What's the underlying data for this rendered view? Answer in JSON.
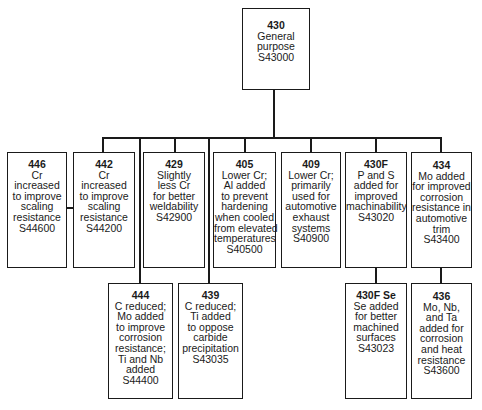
{
  "diagram": {
    "type": "tree",
    "root": {
      "code": "430",
      "lines": [
        "General",
        "purpose",
        "S43000"
      ]
    },
    "children": [
      {
        "code": "446",
        "lines": [
          "Cr",
          "increased",
          "to improve",
          "scaling",
          "resistance",
          "S44600"
        ],
        "connected_via": "442"
      },
      {
        "code": "442",
        "lines": [
          "Cr",
          "increased",
          "to improve",
          "scaling",
          "resistance",
          "S44200"
        ]
      },
      {
        "code": "429",
        "lines": [
          "Slightly",
          "less Cr",
          "for better",
          "weldability",
          "S42900"
        ]
      },
      {
        "code": "405",
        "lines": [
          "Lower Cr;",
          "Al added",
          "to prevent",
          "hardening",
          "when cooled",
          "from elevated",
          "temperatures",
          "S40500"
        ]
      },
      {
        "code": "409",
        "lines": [
          "Lower Cr;",
          "primarily",
          "used for",
          "automotive",
          "exhaust",
          "systems",
          "S40900"
        ]
      },
      {
        "code": "430F",
        "lines": [
          "P and S",
          "added for",
          "improved",
          "machinability",
          "S43020"
        ],
        "children": [
          {
            "code": "430F Se",
            "lines": [
              "Se added",
              "for better",
              "machined",
              "surfaces",
              "S43023"
            ]
          }
        ]
      },
      {
        "code": "434",
        "lines": [
          "Mo added",
          "for improved",
          "corrosion",
          "resistance in",
          "automotive",
          "trim",
          "S43400"
        ],
        "children": [
          {
            "code": "436",
            "lines": [
              "Mo, Nb,",
              "and Ta",
              "added for",
              "corrosion",
              "and heat",
              "resistance",
              "S43600"
            ]
          }
        ]
      },
      {
        "code": "444",
        "lines": [
          "C reduced;",
          "Mo added",
          "to improve",
          "corrosion",
          "resistance;",
          "Ti and Nb",
          "added",
          "S44400"
        ],
        "connected_from": "430 bus"
      },
      {
        "code": "439",
        "lines": [
          "C reduced;",
          "Ti added",
          "to oppose",
          "carbide",
          "precipitation",
          "S43035"
        ],
        "connected_from": "430 bus"
      }
    ]
  },
  "boxes": {
    "b430": {
      "code": "430",
      "l": [
        "General",
        "purpose",
        "S43000"
      ]
    },
    "b446": {
      "code": "446",
      "l": [
        "Cr",
        "increased",
        "to improve",
        "scaling",
        "resistance",
        "S44600"
      ]
    },
    "b442": {
      "code": "442",
      "l": [
        "Cr",
        "increased",
        "to improve",
        "scaling",
        "resistance",
        "S44200"
      ]
    },
    "b429": {
      "code": "429",
      "l": [
        "Slightly",
        "less Cr",
        "for better",
        "weldability",
        "S42900"
      ]
    },
    "b405": {
      "code": "405",
      "l": [
        "Lower Cr;",
        "Al added",
        "to prevent",
        "hardening",
        "when cooled",
        "from elevated",
        "temperatures",
        "S40500"
      ]
    },
    "b409": {
      "code": "409",
      "l": [
        "Lower Cr;",
        "primarily",
        "used for",
        "automotive",
        "exhaust",
        "systems",
        "S40900"
      ]
    },
    "b430f": {
      "code": "430F",
      "l": [
        "P and S",
        "added for",
        "improved",
        "machinability",
        "S43020"
      ]
    },
    "b434": {
      "code": "434",
      "l": [
        "Mo added",
        "for improved",
        "corrosion",
        "resistance in",
        "automotive",
        "trim",
        "S43400"
      ]
    },
    "b444": {
      "code": "444",
      "l": [
        "C reduced;",
        "Mo added",
        "to improve",
        "corrosion",
        "resistance;",
        "Ti and Nb",
        "added",
        "S44400"
      ]
    },
    "b439": {
      "code": "439",
      "l": [
        "C reduced;",
        "Ti added",
        "to oppose",
        "carbide",
        "precipitation",
        "S43035"
      ]
    },
    "b430fse": {
      "code": "430F Se",
      "l": [
        "Se added",
        "for better",
        "machined",
        "surfaces",
        "S43023"
      ]
    },
    "b436": {
      "code": "436",
      "l": [
        "Mo, Nb,",
        "and Ta",
        "added for",
        "corrosion",
        "and heat",
        "resistance",
        "S43600"
      ]
    }
  }
}
